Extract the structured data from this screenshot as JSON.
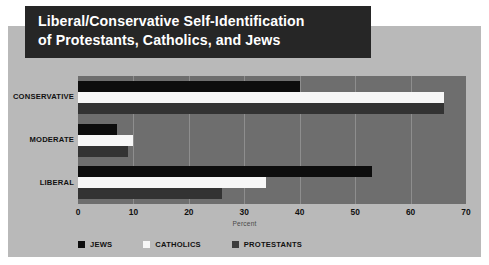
{
  "chart_data": {
    "type": "bar",
    "orientation": "horizontal",
    "title": "Liberal/Conservative Self-Identification\nof Protestants, Catholics, and Jews",
    "xlabel": "Percent",
    "ylabel": "",
    "xlim": [
      0,
      70
    ],
    "xticks": [
      0,
      10,
      20,
      30,
      40,
      50,
      60,
      70
    ],
    "grid": true,
    "legend_position": "bottom",
    "categories": [
      "CONSERVATIVE",
      "MODERATE",
      "LIBERAL"
    ],
    "series": [
      {
        "name": "JEWS",
        "color": "#0d0d0d",
        "values": [
          40,
          7,
          53
        ]
      },
      {
        "name": "CATHOLICS",
        "color": "#f7f7f7",
        "values": [
          66,
          10,
          34
        ]
      },
      {
        "name": "PROTESTANTS",
        "color": "#333333",
        "values": [
          66,
          9,
          26
        ]
      }
    ]
  },
  "colors": {
    "page_background": "#ffffff",
    "panel_background": "#b9b9b9",
    "plot_background": "#6e6e6e",
    "gridline": "#8e8e8e",
    "title_banner": "#262626",
    "title_text": "#ffffff"
  }
}
